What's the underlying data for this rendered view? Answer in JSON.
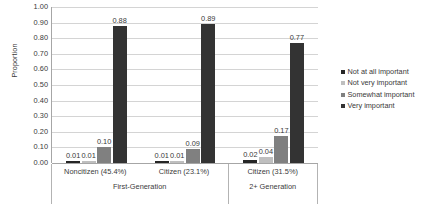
{
  "chart_data": {
    "type": "bar",
    "title": "",
    "subtitle": "",
    "xlabel": "",
    "ylabel": "Proportion",
    "ylim": [
      0,
      1.0
    ],
    "ytick_step": 0.1,
    "ytick_labels": [
      "1.00",
      "0.90",
      "0.80",
      "0.70",
      "0.60",
      "0.50",
      "0.40",
      "0.30",
      "0.20",
      "0.10",
      "0.00"
    ],
    "ytick_values": [
      1.0,
      0.9,
      0.8,
      0.7,
      0.6,
      0.5,
      0.4,
      0.3,
      0.2,
      0.1,
      0.0
    ],
    "grid": true,
    "grid_axis": "y",
    "legend_position": "right",
    "categories": [
      "Noncitizen (45.4%)",
      "Citizen (23.1%)",
      "Citizen (31.5%)"
    ],
    "groups": [
      {
        "label": "First-Generation",
        "categories": [
          "Noncitizen (45.4%)",
          "Citizen (23.1%)"
        ]
      },
      {
        "label": "2+ Generation",
        "categories": [
          "Citizen (31.5%)"
        ]
      }
    ],
    "series": [
      {
        "name": "Not at all important",
        "color": "#262626",
        "values": [
          0.01,
          0.01,
          0.02
        ],
        "labels": [
          "0.01",
          "0.01",
          "0.02"
        ]
      },
      {
        "name": "Not very important",
        "color": "#bfbfbf",
        "values": [
          0.01,
          0.01,
          0.04
        ],
        "labels": [
          "0.01",
          "0.01",
          "0.04"
        ]
      },
      {
        "name": "Somewhat important",
        "color": "#808080",
        "values": [
          0.1,
          0.09,
          0.17
        ],
        "labels": [
          "0.10",
          "0.09",
          "0.17"
        ]
      },
      {
        "name": "Very important",
        "color": "#333333",
        "values": [
          0.88,
          0.89,
          0.77
        ],
        "labels": [
          "0.88",
          "0.89",
          "0.77"
        ]
      }
    ]
  },
  "legend": {
    "items": [
      {
        "label": "Not at all important",
        "color": "#262626"
      },
      {
        "label": "Not very important",
        "color": "#bfbfbf"
      },
      {
        "label": "Somewhat important",
        "color": "#808080"
      },
      {
        "label": "Very important",
        "color": "#333333"
      }
    ]
  },
  "axes": {
    "y_title": "Proportion"
  }
}
